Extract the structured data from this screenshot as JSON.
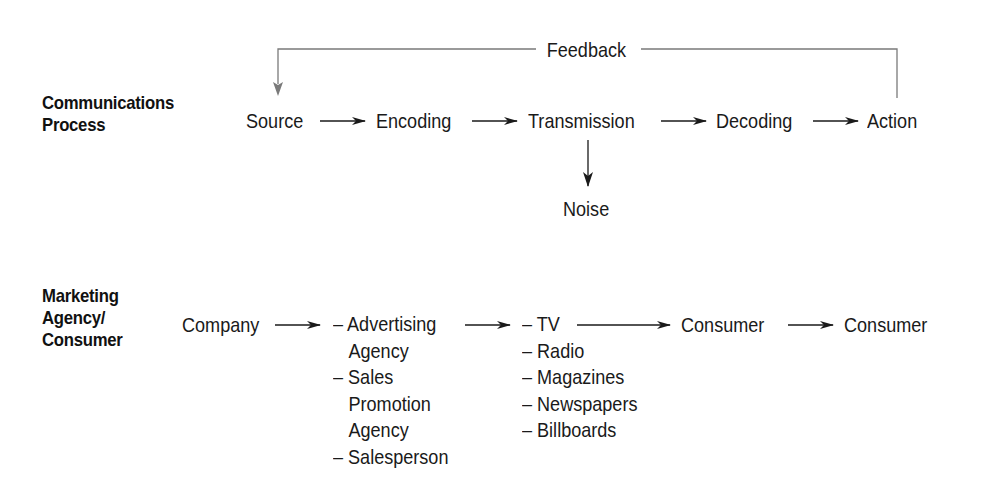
{
  "communications": {
    "label_line1": "Communications",
    "label_line2": "Process",
    "nodes": [
      "Source",
      "Encoding",
      "Transmission",
      "Decoding",
      "Action"
    ],
    "noise": "Noise",
    "feedback": "Feedback"
  },
  "marketing": {
    "label_line1": "Marketing",
    "label_line2": "Agency/",
    "label_line3": "Consumer",
    "company": "Company",
    "agencies": [
      "– Advertising",
      "Agency",
      "– Sales",
      "Promotion",
      "Agency",
      "– Salesperson"
    ],
    "media": [
      "– TV",
      "– Radio",
      "– Magazines",
      "– Newspapers",
      "– Billboards"
    ],
    "consumer1": "Consumer",
    "consumer2": "Consumer"
  },
  "colors": {
    "text": "#1a1a1a",
    "feedback_line": "#7a7a7a",
    "arrow": "#1a1a1a"
  }
}
